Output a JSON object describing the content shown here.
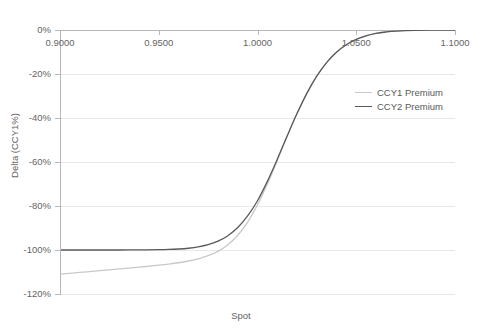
{
  "chart_data": {
    "type": "line",
    "title": "",
    "xlabel": "Spot",
    "ylabel": "Delta (CCY1%)",
    "xlim": [
      0.9,
      1.1
    ],
    "ylim": [
      -1.2,
      0.0
    ],
    "grid": true,
    "legend_position": "right-inside",
    "x_tick_labels": [
      "0.9000",
      "0.9500",
      "1.0000",
      "1.0500",
      "1.1000"
    ],
    "x_ticks": [
      0.9,
      0.95,
      1.0,
      1.05,
      1.1
    ],
    "y_tick_labels": [
      "0%",
      "-20%",
      "-40%",
      "-60%",
      "-80%",
      "-100%",
      "-120%"
    ],
    "y_ticks": [
      0,
      -0.2,
      -0.4,
      -0.6,
      -0.8,
      -1.0,
      -1.2
    ],
    "series": [
      {
        "name": "CCY1 Premium",
        "color": "#c9c9c9",
        "x": [
          0.9,
          0.91,
          0.92,
          0.93,
          0.94,
          0.95,
          0.955,
          0.96,
          0.965,
          0.97,
          0.975,
          0.98,
          0.985,
          0.99,
          0.995,
          1.0,
          1.005,
          1.01,
          1.015,
          1.02,
          1.025,
          1.03,
          1.035,
          1.04,
          1.045,
          1.05,
          1.055,
          1.06,
          1.065,
          1.07,
          1.08,
          1.09,
          1.1
        ],
        "values": [
          -1.11,
          -1.102,
          -1.094,
          -1.086,
          -1.078,
          -1.069,
          -1.064,
          -1.058,
          -1.05,
          -1.04,
          -1.026,
          -1.006,
          -0.976,
          -0.933,
          -0.873,
          -0.795,
          -0.7,
          -0.594,
          -0.484,
          -0.38,
          -0.287,
          -0.209,
          -0.147,
          -0.1,
          -0.066,
          -0.042,
          -0.026,
          -0.015,
          -0.009,
          -0.005,
          -0.001,
          0.0,
          0.0
        ]
      },
      {
        "name": "CCY2 Premium",
        "color": "#595959",
        "x": [
          0.9,
          0.91,
          0.92,
          0.93,
          0.94,
          0.95,
          0.955,
          0.96,
          0.965,
          0.97,
          0.975,
          0.98,
          0.985,
          0.99,
          0.995,
          1.0,
          1.005,
          1.01,
          1.015,
          1.02,
          1.025,
          1.03,
          1.035,
          1.04,
          1.045,
          1.05,
          1.055,
          1.06,
          1.065,
          1.07,
          1.08,
          1.09,
          1.1
        ],
        "values": [
          -1.0,
          -1.0,
          -1.0,
          -1.0,
          -0.9995,
          -0.9985,
          -0.9975,
          -0.9955,
          -0.992,
          -0.986,
          -0.976,
          -0.96,
          -0.935,
          -0.898,
          -0.845,
          -0.776,
          -0.688,
          -0.588,
          -0.482,
          -0.38,
          -0.288,
          -0.21,
          -0.148,
          -0.101,
          -0.067,
          -0.043,
          -0.0265,
          -0.0155,
          -0.009,
          -0.005,
          -0.0012,
          -0.0002,
          0.0
        ]
      }
    ]
  },
  "legend": {
    "items": [
      {
        "label": "CCY1 Premium",
        "color": "#c9c9c9"
      },
      {
        "label": "CCY2 Premium",
        "color": "#595959"
      }
    ]
  },
  "axes": {
    "x_title": "Spot",
    "y_title": "Delta (CCY1%)"
  }
}
